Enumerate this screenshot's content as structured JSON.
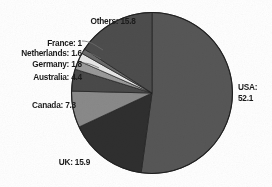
{
  "chart_data": {
    "type": "pie",
    "title": "",
    "subtitle": "",
    "xlabel": "",
    "ylabel": "",
    "legend_position": "none",
    "grid": false,
    "unit": "percent",
    "total": 100.0,
    "start_angle_deg": 0,
    "direction": "clockwise",
    "categories": [
      "USA",
      "UK",
      "Canada",
      "Australia",
      "Germany",
      "Netherlands",
      "France",
      "Others"
    ],
    "values": [
      52.1,
      15.9,
      7.3,
      4.4,
      1.8,
      1.6,
      1.0,
      15.8
    ],
    "colors": [
      "#575757",
      "#2f2f2f",
      "#8a8a8a",
      "#4a4a4a",
      "#9a9a9a",
      "#e8e8e8",
      "#6a6a6a",
      "#4d4d4d"
    ],
    "slices": [
      {
        "name": "USA",
        "value": 52.1,
        "color": "#575757",
        "label": "USA:",
        "value_text": "52.1",
        "label_lines": [
          "USA:",
          "52.1"
        ]
      },
      {
        "name": "UK",
        "value": 15.9,
        "color": "#2f2f2f",
        "label": "UK: 15.9",
        "value_text": "15.9",
        "label_lines": [
          "UK: 15.9"
        ]
      },
      {
        "name": "Canada",
        "value": 7.3,
        "color": "#8a8a8a",
        "label": "Canada: 7.3",
        "value_text": "7.3",
        "label_lines": [
          "Canada: 7.3"
        ]
      },
      {
        "name": "Australia",
        "value": 4.4,
        "color": "#4a4a4a",
        "label": "Australia: 4.4",
        "value_text": "4.4",
        "label_lines": [
          "Australia: 4.4"
        ]
      },
      {
        "name": "Germany",
        "value": 1.8,
        "color": "#9a9a9a",
        "label": "Germany: 1.8",
        "value_text": "1.8",
        "label_lines": [
          "Germany: 1.8"
        ]
      },
      {
        "name": "Netherlands",
        "value": 1.6,
        "color": "#e8e8e8",
        "label": "Netherlands: 1.6",
        "value_text": "1.6",
        "label_lines": [
          "Netherlands: 1.6"
        ]
      },
      {
        "name": "France",
        "value": 1.0,
        "color": "#6a6a6a",
        "label": "France: 1",
        "value_text": "1",
        "label_lines": [
          "France: 1"
        ]
      },
      {
        "name": "Others",
        "value": 15.8,
        "color": "#4d4d4d",
        "label": "Others: 15.8",
        "value_text": "15.8",
        "label_lines": [
          "Others: 15.8"
        ]
      }
    ]
  },
  "labels": {
    "usa_line1": "USA:",
    "usa_line2": "52.1",
    "uk": "UK: 15.9",
    "canada": "Canada: 7.3",
    "australia": "Australia: 4.4",
    "germany": "Germany: 1.8",
    "netherlands": "Netherlands: 1.6",
    "france": "France: 1",
    "others": "Others: 15.8"
  },
  "style": {
    "background": "#ffffff",
    "text_color": "#1b1b1b",
    "slice_outline": "#1f1f1f",
    "leader_line_color": "#6f6f6f"
  }
}
